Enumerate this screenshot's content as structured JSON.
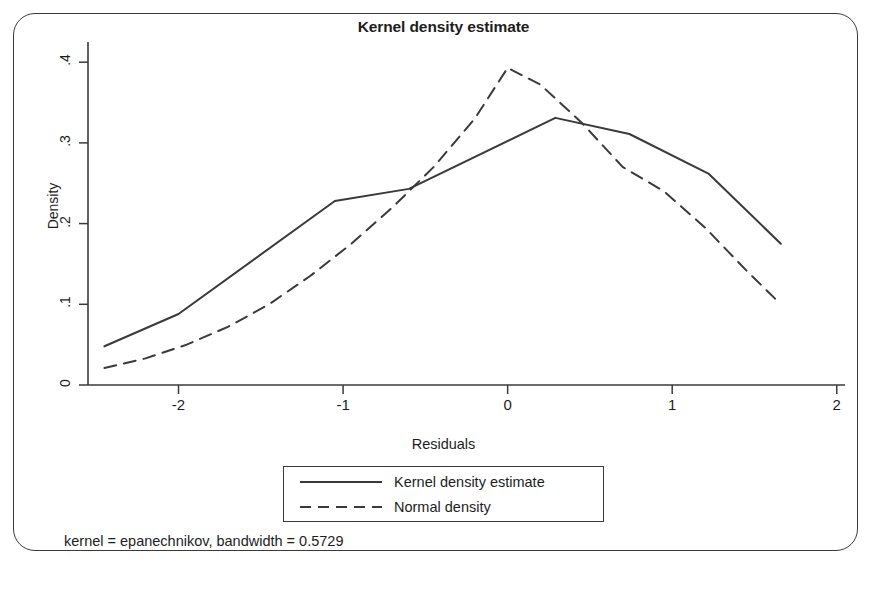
{
  "chart_data": {
    "type": "line",
    "title": "Kernel density estimate",
    "xlabel": "Residuals",
    "ylabel": "Density",
    "xlim": [
      -2.55,
      2.05
    ],
    "ylim": [
      0,
      0.425
    ],
    "xticks": [
      "-2",
      "-1",
      "0",
      "1",
      "2"
    ],
    "xtick_values": [
      -2,
      -1,
      0,
      1,
      2
    ],
    "yticks": [
      "0",
      ".1",
      ".2",
      ".3",
      ".4"
    ],
    "ytick_values": [
      0,
      0.1,
      0.2,
      0.3,
      0.4
    ],
    "grid": false,
    "legend_position": "bottom-center",
    "footnote": "kernel = epanechnikov, bandwidth = 0.5729",
    "series": [
      {
        "name": "Kernel density estimate",
        "style": "solid",
        "color": "#3a3a3a",
        "x": [
          -2.45,
          -2.0,
          -1.05,
          -0.6,
          0.29,
          0.74,
          1.22,
          1.66
        ],
        "y": [
          0.048,
          0.088,
          0.228,
          0.243,
          0.331,
          0.311,
          0.262,
          0.175
        ]
      },
      {
        "name": "Normal density",
        "style": "dashed",
        "color": "#3a3a3a",
        "x": [
          -2.45,
          -2.2,
          -1.95,
          -1.7,
          -1.45,
          -1.2,
          -0.95,
          -0.7,
          -0.45,
          -0.2,
          0.0,
          0.2,
          0.45,
          0.7,
          0.95,
          1.2,
          1.45,
          1.64
        ],
        "y": [
          0.021,
          0.033,
          0.05,
          0.072,
          0.1,
          0.135,
          0.175,
          0.22,
          0.27,
          0.33,
          0.393,
          0.372,
          0.325,
          0.27,
          0.24,
          0.195,
          0.142,
          0.104
        ]
      }
    ]
  },
  "legend": {
    "entries": [
      {
        "label": "Kernel density estimate",
        "style": "solid"
      },
      {
        "label": "Normal density",
        "style": "dashed"
      }
    ]
  }
}
